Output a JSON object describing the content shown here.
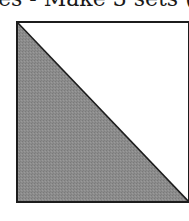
{
  "caption": {
    "text": "es - Make 3 sets ("
  },
  "block": {
    "shape": "half-square-triangle",
    "shaded_half": "lower-left",
    "colors": {
      "shade": "#8c8c8c",
      "light": "#ffffff",
      "line": "#1c1c1c"
    }
  }
}
